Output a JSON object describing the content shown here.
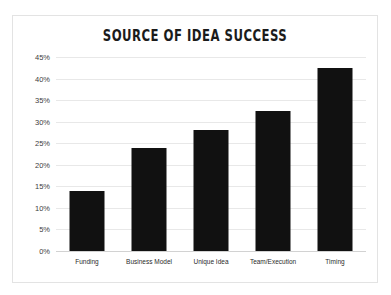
{
  "chart_data": {
    "type": "bar",
    "title": "SOURCE OF IDEA SUCCESS",
    "xlabel": "",
    "ylabel": "",
    "categories": [
      "Funding",
      "Business Model",
      "Unique Idea",
      "Team/Execution",
      "Timing"
    ],
    "values": [
      14,
      24,
      28,
      32.5,
      42.5
    ],
    "value_labels": [
      "14%",
      "24%",
      "28%",
      "32.5%",
      "42.5%"
    ],
    "ylim": [
      0,
      45
    ],
    "ytick_step": 5,
    "ytick_labels": [
      "45%",
      "40%",
      "35%",
      "30%",
      "25%",
      "20%",
      "15%",
      "10%",
      "5%",
      "0%"
    ],
    "ytick_values": [
      45,
      40,
      35,
      30,
      25,
      20,
      15,
      10,
      5,
      0
    ],
    "grid": true,
    "legend": false,
    "colors": {
      "bar": "#111111",
      "grid": "#e8e8e8",
      "axis": "#d2d2d2",
      "title": "#1b1b1b",
      "tick_text": "#3d3d3d",
      "background": "#ffffff",
      "card_border": "#e3e3e3"
    }
  }
}
